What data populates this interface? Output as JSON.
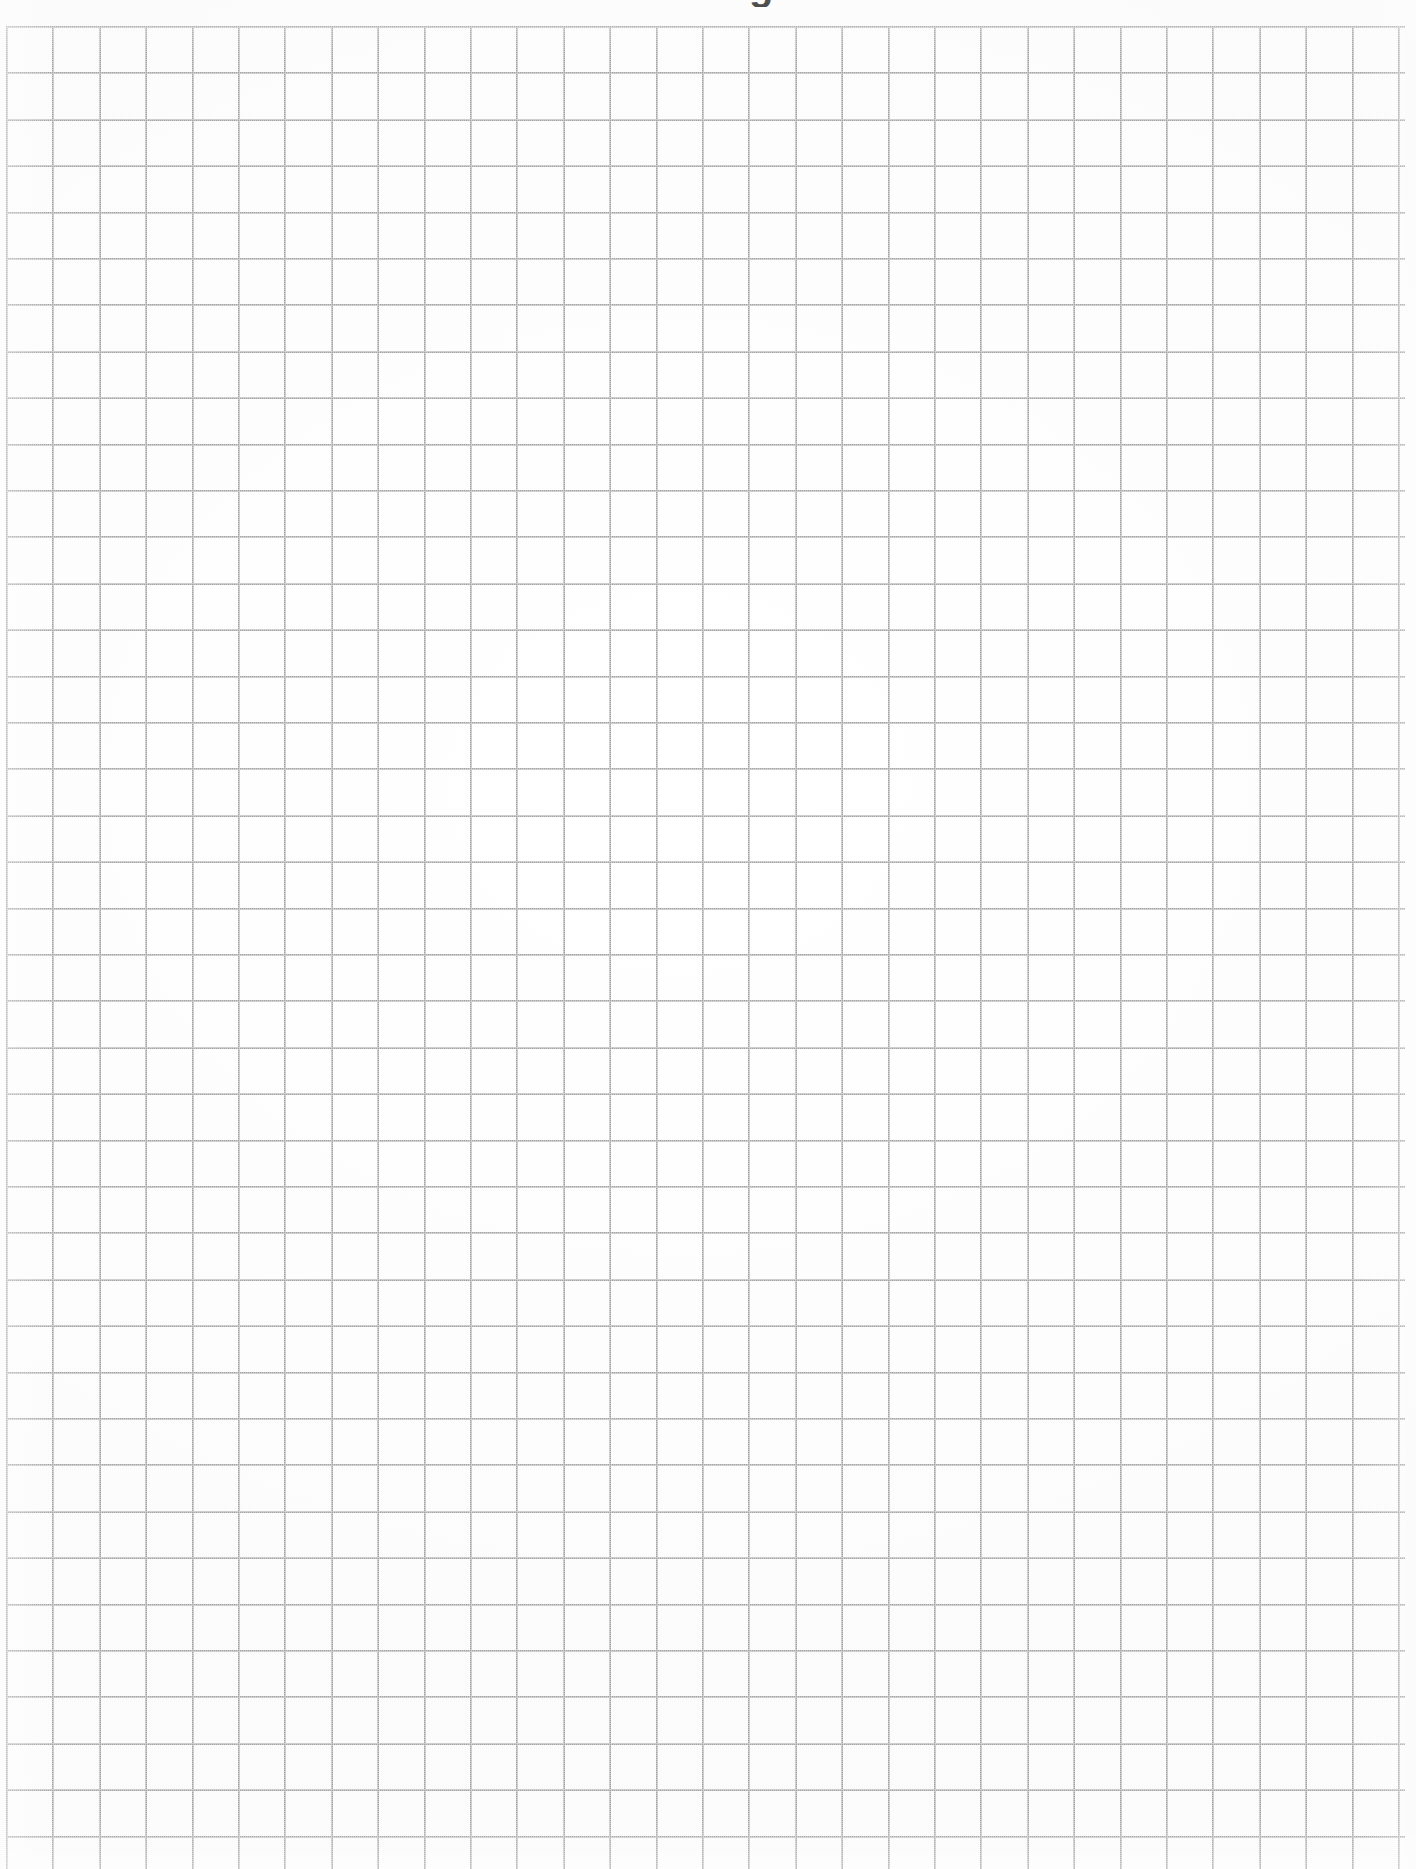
{
  "document": {
    "kind": "scanned-grid-paper",
    "page_width": 1416,
    "page_height": 1869,
    "background_color": "#ffffff"
  },
  "cropped_heading": {
    "text": "g",
    "note": "bottom of a bold character clipped by the top page edge",
    "left": 749,
    "top": 0,
    "width": 40,
    "height": 7,
    "color": "#0a0a0a"
  },
  "grid": {
    "left": 6,
    "top": 26,
    "right": 1405,
    "bottom": 1869,
    "columns": 30,
    "rows": 40,
    "cell_width": 46.4,
    "cell_height": 46.4,
    "line_color": "#a3a3a3",
    "line_width": 2
  }
}
